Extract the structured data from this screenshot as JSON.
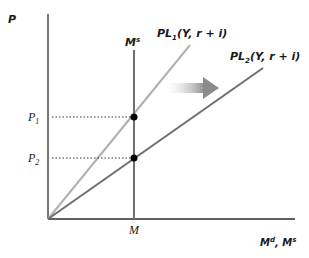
{
  "diagram": {
    "y_axis_label": "P",
    "x_axis_label": "M",
    "x_axis_label_sup": "d",
    "x_axis_label_sep": ", M",
    "x_axis_label_sup2": "s",
    "ms_label": "M",
    "ms_label_sup": "s",
    "pl1_label_main": "PL",
    "pl1_label_sub": "1",
    "pl1_label_args": "(Y, r + i)",
    "pl2_label_main": "PL",
    "pl2_label_sub": "2",
    "pl2_label_args": "(Y, r + i)",
    "p1_label": "P",
    "p1_sub": "1",
    "p2_label": "P",
    "p2_sub": "2",
    "m_tick_label": "M",
    "colors": {
      "axis": "#2a2a2a",
      "ms_line": "#707070",
      "pl1_line": "#b0b0b0",
      "pl2_line": "#6e6e6e",
      "arrow": "#9a9a9a",
      "dot": "#000000"
    }
  }
}
